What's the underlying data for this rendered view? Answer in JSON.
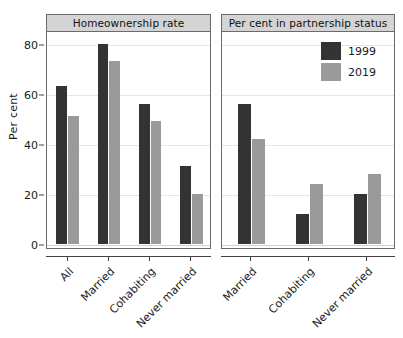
{
  "chart_data": {
    "type": "bar",
    "title": "",
    "xlabel": "",
    "ylabel": "Per cent",
    "ylim": [
      0,
      85
    ],
    "yticks": [
      0,
      20,
      40,
      60,
      80
    ],
    "ytick_labels": [
      "0",
      "20",
      "40",
      "60",
      "80"
    ],
    "grid": true,
    "legend_position": "top-right of right panel",
    "series_names": [
      "1999",
      "2019"
    ],
    "series_colors": [
      "#333333",
      "#9a9a9a"
    ],
    "panels": [
      {
        "title": "Homeownership rate",
        "categories": [
          "All",
          "Married",
          "Cohabiting",
          "Never married"
        ],
        "series": [
          {
            "name": "1999",
            "values": [
              63,
              80,
              56,
              31
            ]
          },
          {
            "name": "2019",
            "values": [
              51,
              73,
              49,
              20
            ]
          }
        ]
      },
      {
        "title": "Per cent in partnership status",
        "categories": [
          "Married",
          "Cohabiting",
          "Never married"
        ],
        "series": [
          {
            "name": "1999",
            "values": [
              56,
              12,
              20
            ]
          },
          {
            "name": "2019",
            "values": [
              42,
              24,
              28
            ]
          }
        ]
      }
    ]
  },
  "legend": {
    "items": [
      {
        "label": "1999",
        "color": "#333333"
      },
      {
        "label": "2019",
        "color": "#9a9a9a"
      }
    ]
  },
  "axis": {
    "ylabel": "Per cent",
    "ytick_labels": [
      "0",
      "20",
      "40",
      "60",
      "80"
    ]
  },
  "panel_titles": {
    "left": "Homeownership rate",
    "right": "Per cent in partnership status"
  }
}
